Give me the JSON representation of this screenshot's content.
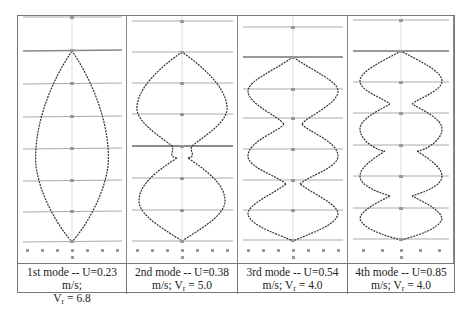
{
  "figure": {
    "panels": [
      {
        "mode": "1st mode",
        "caption_line1": "1st mode -- U=0.23 m/s;",
        "caption_line2_prefix": "V",
        "caption_line2_sub": "r",
        "caption_line2_suffix": " = 6.8",
        "U_m_per_s": 0.23,
        "Vr": 6.8,
        "nodes": 0
      },
      {
        "mode": "2nd mode",
        "caption_line1": "2nd mode -- U=0.38",
        "caption_line2_prefix": "m/s; V",
        "caption_line2_sub": "r",
        "caption_line2_suffix": " = 5.0",
        "U_m_per_s": 0.38,
        "Vr": 5.0,
        "nodes": 1
      },
      {
        "mode": "3rd mode",
        "caption_line1": "3rd mode -- U=0.54",
        "caption_line2_prefix": "m/s; V",
        "caption_line2_sub": "r",
        "caption_line2_suffix": " = 4.0",
        "U_m_per_s": 0.54,
        "Vr": 4.0,
        "nodes": 2
      },
      {
        "mode": "4th mode",
        "caption_line1": "4th mode -- U=0.85",
        "caption_line2_prefix": "m/s; V",
        "caption_line2_sub": "r",
        "caption_line2_suffix": " = 4.0",
        "U_m_per_s": 0.85,
        "Vr": 4.0,
        "nodes": 3
      }
    ],
    "colors": {
      "curve": "#333333",
      "grid": "#999999",
      "border": "#777777",
      "background": "#ffffff"
    }
  }
}
